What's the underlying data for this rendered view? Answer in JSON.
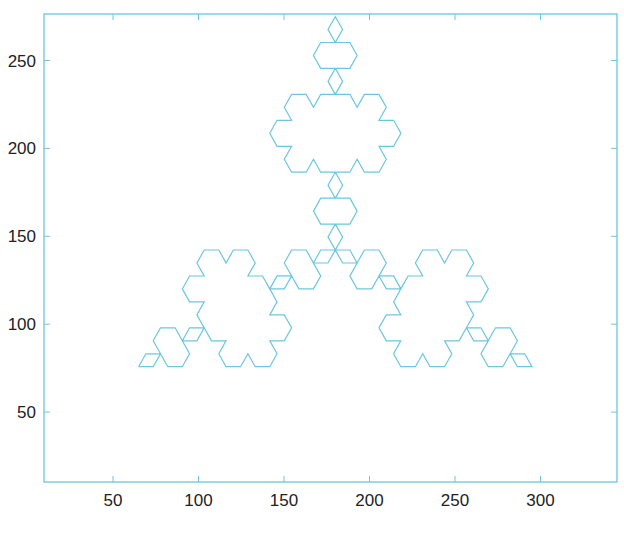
{
  "chart_data": {
    "type": "line",
    "title": "",
    "xlabel": "",
    "ylabel": "",
    "xlim": [
      10,
      345
    ],
    "ylim": [
      10,
      278
    ],
    "x_ticks": [
      50,
      100,
      150,
      200,
      250,
      300
    ],
    "y_ticks": [
      50,
      100,
      150,
      200,
      250
    ],
    "grid": false,
    "legend": null,
    "series": [
      {
        "name": "koch-snowflake",
        "color": "#6cc6e0",
        "depth": 3,
        "base_triangle": [
          [
            65,
            75.8
          ],
          [
            180,
            275
          ],
          [
            295,
            75.8
          ]
        ],
        "extent": {
          "x": [
            64,
            296
          ],
          "y": [
            10,
            275
          ]
        }
      }
    ]
  },
  "style": {
    "axis_color": "#6cc6e0",
    "line_color": "#6cc6e0",
    "label_color": "#222222"
  },
  "layout": {
    "plot_left": 44,
    "plot_right": 617,
    "plot_top": 14,
    "plot_bottom": 482,
    "x_px_per_unit": 1.71,
    "x_px_origin": 27.5,
    "y_px_per_unit": 1.758,
    "y_px_origin": 500
  }
}
